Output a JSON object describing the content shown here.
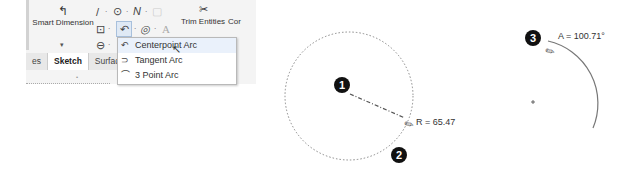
{
  "toolbar": {
    "smart_dimension_label": "Smart Dimension",
    "smart_dimension_icon": "dimension-icon",
    "line_icon": "line-icon",
    "circle_icon": "circle-icon",
    "spline_icon": "spline-icon",
    "rectangle_icon": "rectangle-icon",
    "arc_icon": "centerpoint-arc-icon",
    "ellipse_icon": "ellipse-icon",
    "text_icon": "text-icon",
    "slot_icon": "slot-icon",
    "trim_entities_label": "Trim Entities",
    "convert_label_partial": "Cor",
    "glyphs": {
      "line": "/",
      "circle": "⊙",
      "spline": "N",
      "rect": "⊡",
      "arc": "↶",
      "ellipse": "◎",
      "text": "A",
      "slot": "⊖",
      "dash": "·",
      "trim": "✂",
      "dim": "↰"
    }
  },
  "tabs": [
    {
      "label": "es",
      "active": false
    },
    {
      "label": "Sketch",
      "active": true
    },
    {
      "label": "Surfaces",
      "active": false
    }
  ],
  "arc_menu": {
    "items": [
      {
        "label": "Centerpoint Arc",
        "icon": "centerpoint-arc-icon",
        "glyph": "↶",
        "highlighted": true
      },
      {
        "label": "Tangent Arc",
        "icon": "tangent-arc-icon",
        "glyph": "⊃",
        "highlighted": false
      },
      {
        "label": "3 Point Arc",
        "icon": "three-point-arc-icon",
        "glyph": "⌒",
        "highlighted": false
      }
    ]
  },
  "canvas": {
    "step1": {
      "number": "1",
      "x": 342,
      "y": 85
    },
    "step2": {
      "number": "2",
      "x": 399,
      "y": 155
    },
    "step3": {
      "number": "3",
      "x": 533,
      "y": 38
    },
    "radius_label": "R = 65.47",
    "angle_label": "A = 100.71°",
    "circle": {
      "cx": 349,
      "cy": 96,
      "r": 64
    },
    "arc_center": {
      "x": 533,
      "y": 102
    }
  }
}
